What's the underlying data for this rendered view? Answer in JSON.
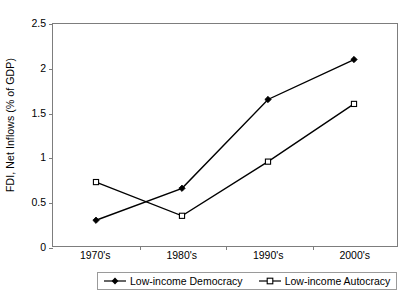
{
  "chart_data": {
    "type": "line",
    "title": "",
    "xlabel": "",
    "ylabel": "FDI, Net Inflows (% of GDP)",
    "categories": [
      "1970's",
      "1980's",
      "1990's",
      "2000's"
    ],
    "ylim": [
      0,
      2.5
    ],
    "yticks": [
      0,
      0.5,
      1,
      1.5,
      2,
      2.5
    ],
    "ytick_labels": [
      "0",
      "0.5",
      "1",
      "1.5",
      "2",
      "2.5"
    ],
    "grid": false,
    "legend_position": "bottom",
    "series": [
      {
        "name": "Low-income Democracy",
        "marker": "filled-diamond",
        "color": "#000000",
        "values": [
          0.29,
          0.65,
          1.65,
          2.1
        ]
      },
      {
        "name": "Low-income Autocracy",
        "marker": "open-square",
        "color": "#000000",
        "values": [
          0.72,
          0.34,
          0.95,
          1.6
        ]
      }
    ]
  },
  "legend": {
    "items": [
      {
        "label": "Low-income Democracy"
      },
      {
        "label": "Low-income Autocracy"
      }
    ]
  }
}
